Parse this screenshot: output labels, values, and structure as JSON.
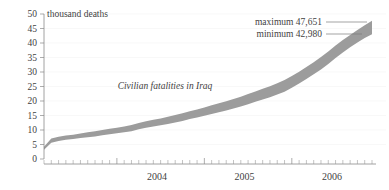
{
  "chart_data": {
    "type": "area",
    "title": "",
    "subtitle": "",
    "series_label": "Civilian fatalities in Iraq",
    "ylabel": "thousand deaths",
    "xlabel": "",
    "ylim": [
      0,
      50
    ],
    "yticks": [
      0,
      5,
      10,
      15,
      20,
      25,
      30,
      35,
      40,
      45,
      50
    ],
    "ytick_labels": [
      "0",
      "5",
      "10",
      "15",
      "20",
      "25",
      "30",
      "35",
      "40",
      "45",
      "50"
    ],
    "xtick_labels": [
      "2004",
      "2005",
      "2006"
    ],
    "xlim": [
      "2003-03",
      "2007-01"
    ],
    "grid": true,
    "legend": "none",
    "minor_tick_interval": "month",
    "annotations": [
      {
        "name": "maximum",
        "label": "maximum 47,651",
        "value": 47.651,
        "raw": "47,651"
      },
      {
        "name": "minimum",
        "label": "minimum 42,980",
        "value": 42.98,
        "raw": "42,980"
      }
    ],
    "x": [
      "2003-03",
      "2003-04",
      "2003-05",
      "2003-06",
      "2003-07",
      "2003-08",
      "2003-09",
      "2003-10",
      "2003-11",
      "2003-12",
      "2004-01",
      "2004-02",
      "2004-03",
      "2004-04",
      "2004-05",
      "2004-06",
      "2004-07",
      "2004-08",
      "2004-09",
      "2004-10",
      "2004-11",
      "2004-12",
      "2005-01",
      "2005-02",
      "2005-03",
      "2005-04",
      "2005-05",
      "2005-06",
      "2005-07",
      "2005-08",
      "2005-09",
      "2005-10",
      "2005-11",
      "2005-12",
      "2006-01",
      "2006-02",
      "2006-03",
      "2006-04",
      "2006-05",
      "2006-06",
      "2006-07",
      "2006-08",
      "2006-09",
      "2006-10",
      "2006-11",
      "2006-12"
    ],
    "series": [
      {
        "name": "minimum",
        "values": [
          3.2,
          5.6,
          6.2,
          6.6,
          6.9,
          7.2,
          7.5,
          7.8,
          8.2,
          8.5,
          8.9,
          9.2,
          9.6,
          10.3,
          10.8,
          11.2,
          11.6,
          12.1,
          12.6,
          13.1,
          13.8,
          14.3,
          14.9,
          15.5,
          16.1,
          16.7,
          17.4,
          18.1,
          18.9,
          19.7,
          20.5,
          21.3,
          22.2,
          23.2,
          24.6,
          26.0,
          27.6,
          29.2,
          30.9,
          32.8,
          34.8,
          36.7,
          38.5,
          40.2,
          41.7,
          42.98
        ]
      },
      {
        "name": "maximum",
        "values": [
          4.2,
          7.1,
          7.7,
          8.1,
          8.4,
          8.8,
          9.2,
          9.6,
          10.0,
          10.4,
          10.8,
          11.2,
          11.7,
          12.4,
          13.0,
          13.5,
          14.0,
          14.6,
          15.2,
          15.8,
          16.5,
          17.1,
          17.8,
          18.5,
          19.2,
          19.9,
          20.7,
          21.5,
          22.4,
          23.3,
          24.2,
          25.1,
          26.1,
          27.2,
          28.6,
          30.1,
          31.7,
          33.4,
          35.2,
          37.1,
          39.1,
          41.0,
          42.8,
          44.5,
          46.1,
          47.651
        ]
      }
    ]
  }
}
